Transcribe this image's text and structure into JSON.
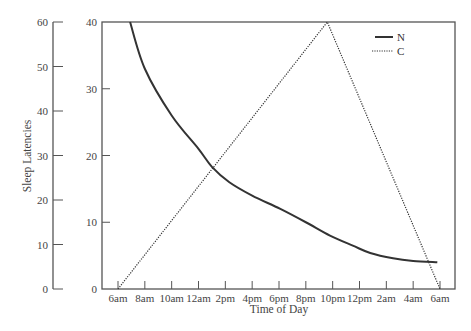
{
  "chart_data": {
    "type": "line",
    "title": "",
    "xlabel": "Time of Day",
    "ylabel": "Sleep Latencies",
    "x_tick_labels": [
      "6am",
      "8am",
      "10am",
      "12am",
      "2pm",
      "4pm",
      "6pm",
      "8pm",
      "10pm",
      "12pm",
      "2am",
      "4am",
      "6am"
    ],
    "x_unit": "hours since 6am",
    "xlim": [
      0,
      24
    ],
    "left_axis": {
      "ticks": [
        0,
        10,
        20,
        30,
        40,
        50,
        60
      ],
      "ylim": [
        0,
        60
      ]
    },
    "inner_axis": {
      "ticks": [
        0,
        10,
        20,
        30,
        40
      ],
      "ylim": [
        0,
        40
      ]
    },
    "grid": false,
    "legend_position": "top-right",
    "series": [
      {
        "name": "N",
        "style": "solid",
        "points": [
          [
            0.9,
            40
          ],
          [
            2.0,
            33
          ],
          [
            4.0,
            26
          ],
          [
            6.0,
            21
          ],
          [
            7.0,
            18.3
          ],
          [
            8.3,
            16
          ],
          [
            10.0,
            14
          ],
          [
            12.1,
            12
          ],
          [
            14.0,
            10
          ],
          [
            15.8,
            8
          ],
          [
            17.5,
            6.5
          ],
          [
            18.8,
            5.4
          ],
          [
            20.5,
            4.6
          ],
          [
            22.0,
            4.2
          ],
          [
            23.8,
            4
          ]
        ]
      },
      {
        "name": "C",
        "style": "dotted",
        "points": [
          [
            0,
            0
          ],
          [
            15.6,
            40
          ],
          [
            24,
            0
          ]
        ]
      }
    ]
  },
  "legend": {
    "items": [
      {
        "label": "N",
        "style": "solid"
      },
      {
        "label": "C",
        "style": "dotted"
      }
    ]
  },
  "colors": {
    "axis": "#555555",
    "line": "#333333",
    "text": "#444444"
  }
}
